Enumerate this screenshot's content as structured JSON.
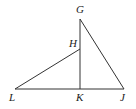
{
  "diagram": {
    "type": "geometry",
    "points": {
      "G": {
        "label": "G",
        "x": 80,
        "y": 19,
        "label_x": 76,
        "label_y": 13
      },
      "H": {
        "label": "H",
        "x": 80,
        "y": 49,
        "label_x": 69,
        "label_y": 47
      },
      "K": {
        "label": "K",
        "x": 80,
        "y": 89,
        "label_x": 76,
        "label_y": 101
      },
      "L": {
        "label": "L",
        "x": 15,
        "y": 89,
        "label_x": 9,
        "label_y": 101
      },
      "J": {
        "label": "J",
        "x": 124,
        "y": 89,
        "label_x": 120,
        "label_y": 101
      }
    },
    "segments": [
      {
        "from": "L",
        "to": "J"
      },
      {
        "from": "G",
        "to": "K"
      },
      {
        "from": "G",
        "to": "J"
      },
      {
        "from": "L",
        "to": "H"
      }
    ],
    "line_color": "#333333",
    "label_color": "#222222"
  }
}
